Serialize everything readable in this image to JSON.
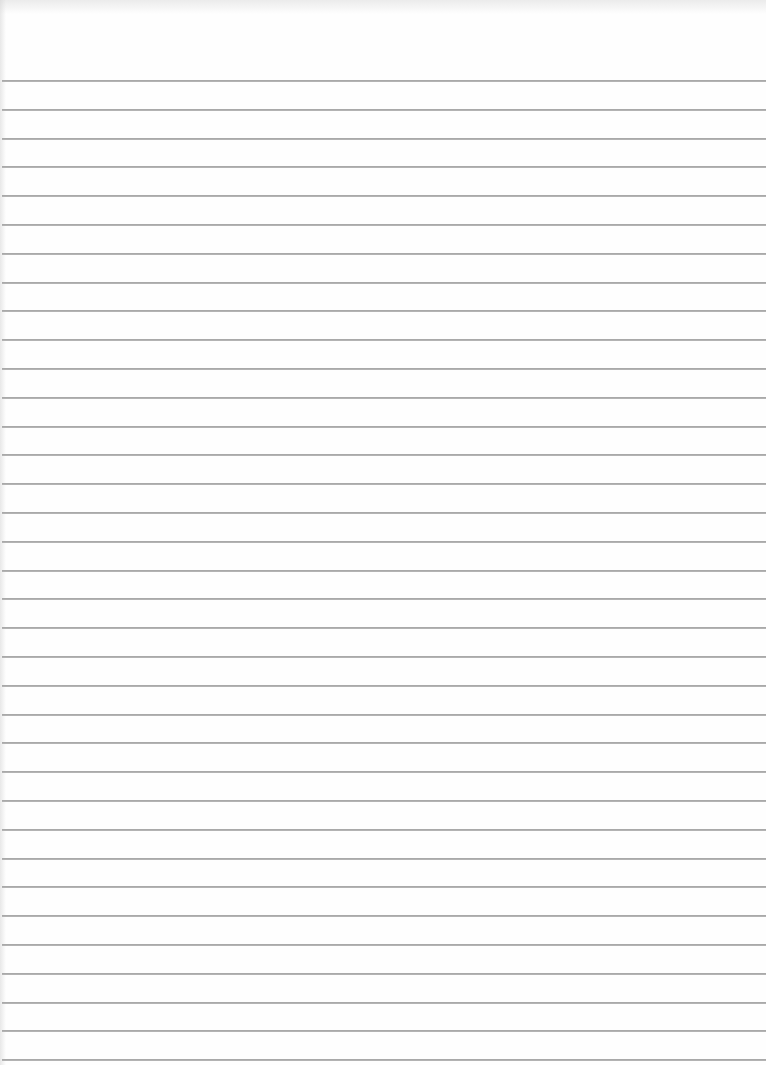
{
  "page": {
    "type": "lined-notebook-paper",
    "background_color": "#fefefe",
    "line_color": "#a9a9a9",
    "first_line_y": 80,
    "line_spacing": 28.8,
    "line_count": 35
  }
}
